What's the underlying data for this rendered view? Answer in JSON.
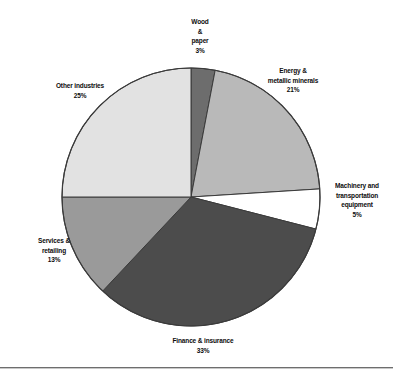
{
  "chart_data": {
    "type": "pie",
    "title": "",
    "subtitle": "",
    "xlabel": "",
    "ylabel": "",
    "legend_position": "none",
    "grid": false,
    "labels_inline": true,
    "start_angle_deg": 0,
    "direction": "clockwise",
    "categories": [
      "Wood & paper",
      "Energy & metallic minerals",
      "Machinery and transportation equipment",
      "Finance & insurance",
      "Services & retailing",
      "Other industries"
    ],
    "values": [
      3,
      21,
      5,
      33,
      13,
      25
    ],
    "unit": "%",
    "total": 100,
    "slices": [
      {
        "name": "wood-paper",
        "label_lines": [
          "Wood",
          "&",
          "paper"
        ],
        "value_text": "3%",
        "value": 3,
        "color": "#6d6d6d"
      },
      {
        "name": "energy-metallic-minerals",
        "label_lines": [
          "Energy &",
          "metallic minerals"
        ],
        "value_text": "21%",
        "value": 21,
        "color": "#b9b9b9"
      },
      {
        "name": "machinery-transportation-equipment",
        "label_lines": [
          "Machinery and",
          "transportation",
          "equipment"
        ],
        "value_text": "5%",
        "value": 5,
        "color": "#ffffff"
      },
      {
        "name": "finance-insurance",
        "label_lines": [
          "Finance & insurance"
        ],
        "value_text": "33%",
        "value": 33,
        "color": "#4c4c4c"
      },
      {
        "name": "services-retailing",
        "label_lines": [
          "Services &",
          "retailing"
        ],
        "value_text": "13%",
        "value": 13,
        "color": "#9a9a9a"
      },
      {
        "name": "other-industries",
        "label_lines": [
          "Other industries"
        ],
        "value_text": "25%",
        "value": 25,
        "color": "#e2e2e2"
      }
    ],
    "colors": {
      "outline": "#3b3b3b",
      "text": "#0d0d0d",
      "background": "#ffffff",
      "rule": "#6e6e6e"
    },
    "geometry": {
      "center_x": 191,
      "center_y": 197,
      "radius": 129
    }
  },
  "labels": {
    "wood_paper": {
      "line1": "Wood",
      "line2": "&",
      "line3": "paper",
      "value": "3%"
    },
    "energy": {
      "line1": "Energy &",
      "line2": "metallic minerals",
      "value": "21%"
    },
    "machinery": {
      "line1": "Machinery and",
      "line2": "transportation",
      "line3": "equipment",
      "value": "5%"
    },
    "finance": {
      "line1": "Finance & insurance",
      "value": "33%"
    },
    "services": {
      "line1": "Services &",
      "line2": "retailing",
      "value": "13%"
    },
    "other": {
      "line1": "Other industries",
      "value": "25%"
    }
  }
}
